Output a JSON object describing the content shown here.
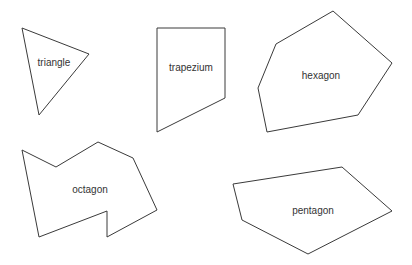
{
  "diagram": {
    "title": "",
    "stroke_color": "#3a3a3a",
    "background": "#ffffff",
    "shapes": [
      {
        "name": "triangle",
        "label": "triangle",
        "points": "22,28 89,54 39,115",
        "label_pos": [
          54,
          62
        ]
      },
      {
        "name": "trapezium",
        "label": "trapezium",
        "points": "157,28 225,28 225,98 157,132",
        "label_pos": [
          191,
          67
        ]
      },
      {
        "name": "hexagon",
        "label": "hexagon",
        "points": "333,11 392,63 358,115 267,132 258,88 276,44",
        "label_pos": [
          321,
          75
        ]
      },
      {
        "name": "octagon",
        "label": "octagon",
        "points": "22,150 56,167 98,142 133,158 157,210 107,237 107,211 39,237",
        "label_pos": [
          90,
          189
        ]
      },
      {
        "name": "pentagon",
        "label": "pentagon",
        "points": "233,184 342,167 392,211 308,254 242,220",
        "label_pos": [
          313,
          210
        ]
      }
    ]
  }
}
